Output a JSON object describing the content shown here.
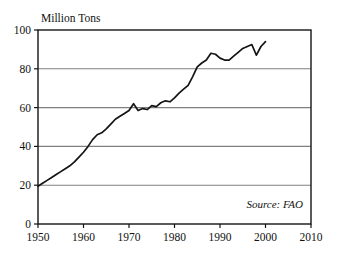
{
  "chart_data": {
    "type": "line",
    "title": "",
    "subtitle": "",
    "xlabel": "",
    "ylabel": "Million Tons",
    "ylabel_position": "top-left-above-axis",
    "xlim": [
      1950,
      2010
    ],
    "ylim": [
      0,
      100
    ],
    "yticks": [
      0,
      20,
      40,
      60,
      80,
      100
    ],
    "ytick_labels": [
      "0",
      "20",
      "40",
      "60",
      "80",
      "100"
    ],
    "xticks": [
      1950,
      1960,
      1970,
      1980,
      1990,
      2000,
      2010
    ],
    "xtick_labels": [
      "1950",
      "1960",
      "1970",
      "1980",
      "1990",
      "2000",
      "2010"
    ],
    "grid": "horizontal",
    "grid_values": [
      20,
      40,
      60,
      80
    ],
    "legend": null,
    "annotations": [
      {
        "text": "Source: FAO",
        "x": 2000,
        "y": 10,
        "style": "italic",
        "align": "right"
      }
    ],
    "line_color": "#141414",
    "grid_color": "#808080",
    "axis_color": "#141414",
    "background_color": "#ffffff",
    "series": [
      {
        "name": "Production",
        "units": "Million Tons",
        "x": [
          1950,
          1951,
          1952,
          1953,
          1954,
          1955,
          1956,
          1957,
          1958,
          1959,
          1960,
          1961,
          1962,
          1963,
          1964,
          1965,
          1966,
          1967,
          1968,
          1969,
          1970,
          1971,
          1972,
          1973,
          1974,
          1975,
          1976,
          1977,
          1978,
          1979,
          1980,
          1981,
          1982,
          1983,
          1984,
          1985,
          1986,
          1987,
          1988,
          1989,
          1990,
          1991,
          1992,
          1993,
          1994,
          1995,
          1996,
          1997,
          1998,
          1999,
          2000
        ],
        "values": [
          19.5,
          21.0,
          22.5,
          24.0,
          25.5,
          27.0,
          28.5,
          30.0,
          32.0,
          34.5,
          37.0,
          40.0,
          43.5,
          46.0,
          47.0,
          49.0,
          51.5,
          54.0,
          55.5,
          57.0,
          58.5,
          62.0,
          58.5,
          59.5,
          59.0,
          61.0,
          60.5,
          62.5,
          63.5,
          63.0,
          65.0,
          67.5,
          69.5,
          71.5,
          76.0,
          81.0,
          83.0,
          84.5,
          88.0,
          87.5,
          85.5,
          84.5,
          84.5,
          86.5,
          88.5,
          90.5,
          91.5,
          92.5,
          87.0,
          91.5,
          94.0
        ]
      }
    ]
  },
  "figure": {
    "source_note": "Source: FAO",
    "y_axis_title": "Million Tons"
  }
}
